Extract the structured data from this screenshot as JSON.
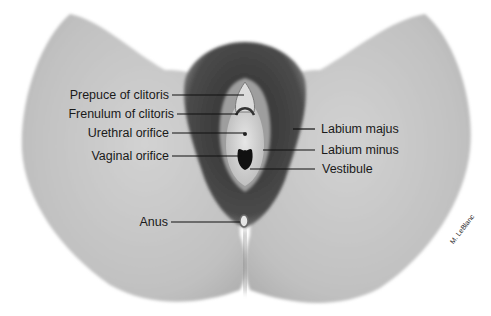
{
  "figure": {
    "type": "anatomical-illustration",
    "style": "grayscale shaded drawing",
    "colors": {
      "background": "#ffffff",
      "skin": "#c4c4c4",
      "skin_shadow": "#9a9a9a",
      "hair": "#3a3a3a",
      "inner_tissue": "#d8d8d8",
      "leader_line": "#111111",
      "text": "#1a1a1a"
    }
  },
  "labels": {
    "left": [
      {
        "id": "prepuce",
        "text": "Prepuce of clitoris"
      },
      {
        "id": "frenulum",
        "text": "Frenulum of clitoris"
      },
      {
        "id": "urethral",
        "text": "Urethral orifice"
      },
      {
        "id": "vaginal",
        "text": "Vaginal orifice"
      },
      {
        "id": "anus",
        "text": "Anus"
      }
    ],
    "right": [
      {
        "id": "labium_majus",
        "text": "Labium majus"
      },
      {
        "id": "labium_minus",
        "text": "Labium minus"
      },
      {
        "id": "vestibule",
        "text": "Vestibule"
      }
    ]
  },
  "signature": "M. LeBlanc"
}
